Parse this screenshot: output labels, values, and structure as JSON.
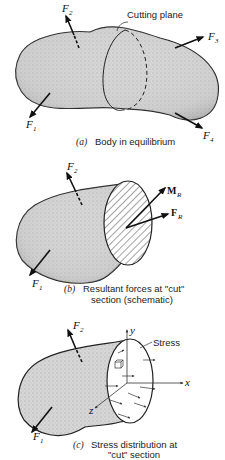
{
  "panels": [
    {
      "id": "a",
      "caption_letter": "(a)",
      "caption": "Body in equilibrium",
      "labels": {
        "cutting_plane": "Cutting plane"
      },
      "forces": [
        {
          "name": "F",
          "sub": "1"
        },
        {
          "name": "F",
          "sub": "2"
        },
        {
          "name": "F",
          "sub": "3"
        },
        {
          "name": "F",
          "sub": "4"
        }
      ]
    },
    {
      "id": "b",
      "caption_letter": "(b)",
      "caption_line1": "Resultant forces at \"cut\"",
      "caption_line2": "section (schematic)",
      "forces": [
        {
          "name": "F",
          "sub": "1"
        },
        {
          "name": "F",
          "sub": "2"
        },
        {
          "name": "M",
          "sub": "R"
        },
        {
          "name": "F",
          "sub": "R"
        }
      ]
    },
    {
      "id": "c",
      "caption_letter": "(c)",
      "caption_line1": "Stress distribution at",
      "caption_line2": "\"cut\" section",
      "labels": {
        "stress": "Stress",
        "x_axis": "x",
        "y_axis": "y",
        "z_axis": "z"
      },
      "forces": [
        {
          "name": "F",
          "sub": "1"
        },
        {
          "name": "F",
          "sub": "2"
        }
      ]
    }
  ]
}
